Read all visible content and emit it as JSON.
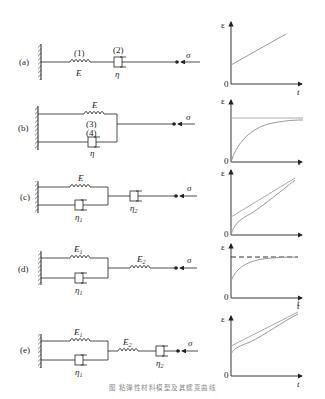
{
  "figure": {
    "caption": "图 粘弹性材料模型及其蠕变曲线",
    "axis_labels": {
      "y": "ε",
      "x": "t",
      "origin": "0"
    },
    "load_symbol": "σ",
    "colors": {
      "line": "#222222",
      "curve": "#999999",
      "hatch": "#444444"
    }
  },
  "rows": [
    {
      "id": "a",
      "tag": "(a)",
      "model": "Maxwell (series spring + dashpot)",
      "elements": [
        {
          "type": "spring",
          "number": "(1)",
          "label": "E"
        },
        {
          "type": "dashpot",
          "number": "(2)",
          "label": "η"
        }
      ],
      "curve": "linear ramp with instantaneous offset"
    },
    {
      "id": "b",
      "tag": "(b)",
      "model": "Kelvin-Voigt (parallel spring + dashpot)",
      "elements": [
        {
          "type": "spring",
          "number": "(3)",
          "label": "E"
        },
        {
          "type": "dashpot",
          "number": "(4)",
          "label": "η"
        }
      ],
      "curve": "exponential approach to horizontal asymptote from 0"
    },
    {
      "id": "c",
      "tag": "(c)",
      "model": "Kelvin-Voigt in series with dashpot",
      "elements": [
        {
          "type": "spring",
          "label": "E"
        },
        {
          "type": "dashpot",
          "label": "η",
          "sub": "1"
        },
        {
          "type": "dashpot",
          "label": "η",
          "sub": "2"
        }
      ],
      "curve": "curved start converging to linear asymptote"
    },
    {
      "id": "d",
      "tag": "(d)",
      "model": "Standard linear solid (Kelvin + spring)",
      "elements": [
        {
          "type": "spring",
          "label": "E",
          "sub": "1"
        },
        {
          "type": "dashpot",
          "label": "η",
          "sub": "1"
        },
        {
          "type": "spring",
          "label": "E",
          "sub": "2"
        }
      ],
      "curve": "instantaneous jump then exponential to dashed asymptote"
    },
    {
      "id": "e",
      "tag": "(e)",
      "model": "Burgers (Kelvin + spring + dashpot)",
      "elements": [
        {
          "type": "spring",
          "label": "E",
          "sub": "1"
        },
        {
          "type": "dashpot",
          "label": "η",
          "sub": "1"
        },
        {
          "type": "spring",
          "label": "E",
          "sub": "2"
        },
        {
          "type": "dashpot",
          "label": "η",
          "sub": "2"
        }
      ],
      "curve": "instantaneous jump, curved transition, linear asymptote"
    }
  ]
}
